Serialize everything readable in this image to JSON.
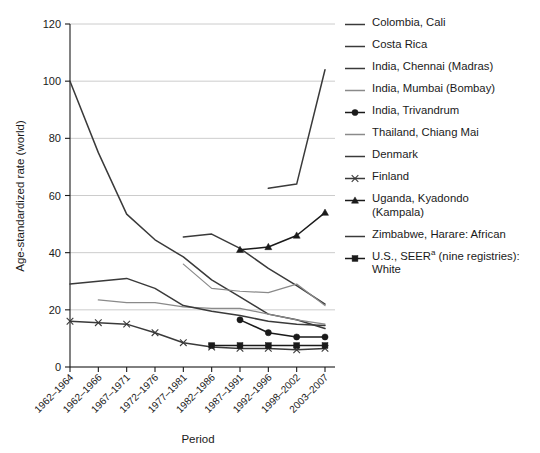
{
  "chart_data": {
    "type": "line",
    "title": "",
    "xlabel": "Period",
    "ylabel": "Age-standardized rate (world)",
    "ylim": [
      0,
      120
    ],
    "yticks": [
      0,
      20,
      40,
      60,
      80,
      100,
      120
    ],
    "grid": true,
    "legend_position": "right",
    "categories": [
      "1962–1964",
      "1962–1966",
      "1967–1971",
      "1972–1976",
      "1977–1981",
      "1982–1986",
      "1987–1991",
      "1992–1996",
      "1998–2002",
      "2003–2007"
    ],
    "series": [
      {
        "name": "Colombia, Cali",
        "marker": "none",
        "color": "#3a3a3a",
        "values": [
          100,
          75,
          53.5,
          44.5,
          38.5,
          30.5,
          24.5,
          18.5,
          16.5,
          13.5
        ]
      },
      {
        "name": "Costa Rica",
        "marker": "none",
        "color": "#3a3a3a",
        "values": [
          null,
          null,
          null,
          null,
          null,
          null,
          null,
          62.5,
          64,
          104
        ]
      },
      {
        "name": "India, Chennai (Madras)",
        "marker": "none",
        "color": "#3a3a3a",
        "values": [
          null,
          null,
          null,
          null,
          45.5,
          46.5,
          41.5,
          34.5,
          28.5,
          22
        ]
      },
      {
        "name": "India, Mumbai (Bombay)",
        "marker": "none",
        "color": "#8a8a8a",
        "values": [
          null,
          null,
          null,
          null,
          36,
          27.5,
          26.5,
          26,
          29,
          21.5
        ]
      },
      {
        "name": "India, Trivandrum",
        "marker": "circle",
        "color": "#1a1a1a",
        "values": [
          null,
          null,
          null,
          null,
          null,
          null,
          16.5,
          12,
          10.5,
          10.5
        ]
      },
      {
        "name": "Thailand, Chiang Mai",
        "marker": "none",
        "color": "#8a8a8a",
        "values": [
          null,
          23.5,
          22.5,
          22.5,
          21,
          20.5,
          20.5,
          18.5,
          16.5,
          15
        ]
      },
      {
        "name": "Denmark",
        "marker": "none",
        "color": "#3a3a3a",
        "values": [
          29,
          30,
          31,
          27.5,
          21.5,
          19.5,
          18,
          16,
          15,
          14.5
        ]
      },
      {
        "name": "Finland",
        "marker": "x",
        "color": "#3a3a3a",
        "values": [
          16,
          15.5,
          15,
          12,
          8.5,
          7,
          6.5,
          6.5,
          6,
          6.5
        ]
      },
      {
        "name": "Uganda, Kyadondo\n(Kampala)",
        "marker": "triangle",
        "color": "#1a1a1a",
        "values": [
          null,
          null,
          null,
          null,
          null,
          null,
          41,
          42,
          46,
          54
        ]
      },
      {
        "name": "Zimbabwe, Harare: African",
        "marker": "none",
        "color": "#3a3a3a",
        "values": [
          null,
          null,
          null,
          null,
          null,
          null,
          null,
          null,
          null,
          null
        ]
      },
      {
        "name": "U.S., SEERᵃ (nine registries):\nWhite",
        "marker": "square",
        "color": "#1a1a1a",
        "values": [
          null,
          null,
          null,
          null,
          null,
          7.5,
          7.5,
          7.5,
          7.5,
          7.5
        ]
      }
    ],
    "legend_entries": [
      {
        "label": "Colombia, Cali",
        "marker": "none",
        "color": "#3a3a3a"
      },
      {
        "label": "Costa Rica",
        "marker": "none",
        "color": "#3a3a3a"
      },
      {
        "label": "India, Chennai (Madras)",
        "marker": "none",
        "color": "#3a3a3a"
      },
      {
        "label": "India, Mumbai (Bombay)",
        "marker": "none",
        "color": "#8a8a8a"
      },
      {
        "label": "India, Trivandrum",
        "marker": "circle",
        "color": "#1a1a1a"
      },
      {
        "label": "Thailand, Chiang Mai",
        "marker": "none",
        "color": "#8a8a8a"
      },
      {
        "label": "Denmark",
        "marker": "none",
        "color": "#3a3a3a"
      },
      {
        "label": "Finland",
        "marker": "x",
        "color": "#3a3a3a"
      },
      {
        "label": "Uganda, Kyadondo\n(Kampala)",
        "marker": "triangle",
        "color": "#1a1a1a"
      },
      {
        "label": "Zimbabwe, Harare: African",
        "marker": "none",
        "color": "#3a3a3a"
      },
      {
        "label": "U.S., SEERᵃ (nine registries):\nWhite",
        "marker": "square",
        "color": "#1a1a1a"
      }
    ]
  }
}
